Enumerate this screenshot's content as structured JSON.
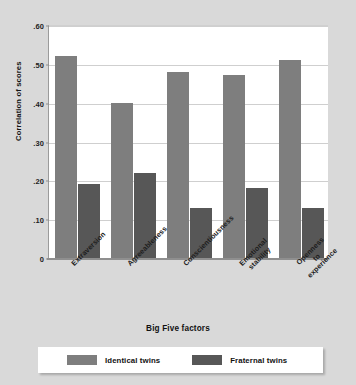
{
  "chart_data": {
    "type": "bar",
    "title": "",
    "xlabel": "Big Five factors",
    "ylabel": "Correlation of scores",
    "categories": [
      "Extraversion",
      "Agreeableness",
      "Conscientiousness",
      "Emotional stability",
      "Openness to experience"
    ],
    "category_lines": [
      [
        "Extraversion"
      ],
      [
        "Agreeableness"
      ],
      [
        "Conscientiousness"
      ],
      [
        "Emotional",
        "stability"
      ],
      [
        "Openness",
        "to",
        "experience"
      ]
    ],
    "series": [
      {
        "name": "Identical twins",
        "color": "#7e7e7e",
        "values": [
          0.52,
          0.4,
          0.48,
          0.47,
          0.51
        ]
      },
      {
        "name": "Fraternal twins",
        "color": "#575757",
        "values": [
          0.19,
          0.22,
          0.13,
          0.18,
          0.13
        ]
      }
    ],
    "ylim": [
      0,
      0.6
    ],
    "yticks": [
      0.6,
      0.5,
      0.4,
      0.3,
      0.2,
      0.1,
      0
    ],
    "ytick_labels": [
      ".60",
      ".50",
      ".40",
      ".30",
      ".20",
      ".10",
      "0"
    ],
    "grid": true,
    "legend_position": "bottom"
  },
  "figure": {
    "background_color": "#d9d9d9",
    "plot_background_color": "#ffffff"
  }
}
